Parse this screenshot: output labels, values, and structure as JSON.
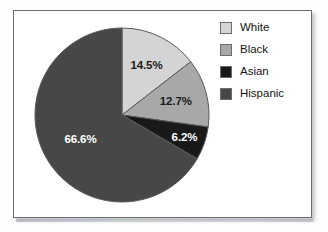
{
  "chart_data": {
    "type": "pie",
    "title": "",
    "subtitle": "",
    "xlabel": "",
    "ylabel": "",
    "legend_position": "right",
    "grid": false,
    "start_angle_deg": 0,
    "direction": "clockwise",
    "categories": [
      "White",
      "Black",
      "Asian",
      "Hispanic"
    ],
    "values": [
      14.5,
      12.7,
      6.2,
      66.6
    ],
    "units": "%",
    "data_labels": [
      "14.5%",
      "12.7%",
      "6.2%",
      "66.6%"
    ],
    "colors": [
      "#d4d4d4",
      "#a8a8a8",
      "#191919",
      "#474747"
    ],
    "slices": [
      {
        "label": "White",
        "value": 14.5,
        "data_label": "14.5%",
        "color": "#d4d4d4",
        "label_color": "dark"
      },
      {
        "label": "Black",
        "value": 12.7,
        "data_label": "12.7%",
        "color": "#a8a8a8",
        "label_color": "dark"
      },
      {
        "label": "Asian",
        "value": 6.2,
        "data_label": "6.2%",
        "color": "#191919",
        "label_color": "light"
      },
      {
        "label": "Hispanic",
        "value": 66.6,
        "data_label": "66.6%",
        "color": "#474747",
        "label_color": "light"
      }
    ]
  },
  "legend": {
    "items": [
      {
        "label": "White",
        "color": "#d4d4d4"
      },
      {
        "label": "Black",
        "color": "#a8a8a8"
      },
      {
        "label": "Asian",
        "color": "#191919"
      },
      {
        "label": "Hispanic",
        "color": "#474747"
      }
    ]
  }
}
